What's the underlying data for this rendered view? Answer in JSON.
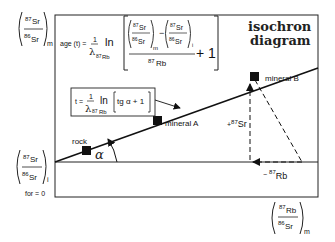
{
  "title": {
    "line1": "isochron",
    "line2": "diagram"
  },
  "y_axis": {
    "measured": {
      "num_mass": "87",
      "num_el": "Sr",
      "den_mass": "86",
      "den_el": "Sr",
      "sub": "m"
    },
    "initial": {
      "num_mass": "87",
      "num_el": "Sr",
      "den_mass": "86",
      "den_el": "Sr",
      "sub": "i",
      "note": "for = 0"
    }
  },
  "x_axis": {
    "num_mass": "87",
    "num_el": "Rb",
    "den_mass": "86",
    "den_el": "Sr",
    "sub": "m"
  },
  "age_formula": {
    "lhs": "age (t) =",
    "one": "1",
    "lambda": "λ",
    "lambda_sub_mass": "87",
    "lambda_sub_el": "Rb",
    "ln": "ln",
    "term1": {
      "num_mass": "87",
      "num_el": "Sr",
      "den_mass": "86",
      "den_el": "Sr",
      "sub": "m"
    },
    "minus": "−",
    "term2": {
      "num_mass": "87",
      "num_el": "Sr",
      "den_mass": "86",
      "den_el": "Sr",
      "sub": "i"
    },
    "denominator_mass": "87",
    "denominator_el": "Rb",
    "plus_one": "+ 1"
  },
  "slope_formula": {
    "lhs": "t =",
    "one": "1",
    "lambda": "λ",
    "lambda_sub_mass": "87",
    "lambda_sub_el": "Rb",
    "ln": "ln",
    "bracket_content": "tg α + 1"
  },
  "points": [
    {
      "label": "rock",
      "x": 86,
      "y": 150
    },
    {
      "label": "mineral A",
      "x": 157,
      "y": 120
    },
    {
      "label": "mineral B",
      "x": 255,
      "y": 77
    }
  ],
  "angle_label": "α",
  "delta_sr": {
    "sign": "+",
    "mass": "87",
    "el": "Sr"
  },
  "delta_rb": {
    "sign": "−",
    "mass": "87",
    "el": "Rb"
  }
}
